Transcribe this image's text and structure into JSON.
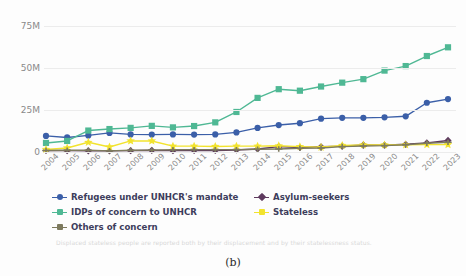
{
  "figure": {
    "title": "",
    "caption": "(b)",
    "footnote": "Displaced stateless people are reported both by their displacement and by their statelessness status."
  },
  "axes": {
    "y_ticks": [
      "0",
      "25M",
      "50M",
      "75M"
    ],
    "y_tick_values": [
      0,
      25,
      50,
      75
    ],
    "x_ticks": [
      "2004",
      "2005",
      "2006",
      "2007",
      "2008",
      "2009",
      "2010",
      "2011",
      "2012",
      "2013",
      "2014",
      "2015",
      "2016",
      "2017",
      "2018",
      "2019",
      "2020",
      "2021",
      "2022",
      "2023"
    ]
  },
  "legend": {
    "items": [
      {
        "label": "Refugees under UNHCR's mandate",
        "color": "#3b5fa8",
        "marker": "circle"
      },
      {
        "label": "Asylum-seekers",
        "color": "#5e3a5e",
        "marker": "diamond"
      },
      {
        "label": "IDPs of concern to UNHCR",
        "color": "#4fb894",
        "marker": "square"
      },
      {
        "label": "Stateless",
        "color": "#f2e32e",
        "marker": "star"
      },
      {
        "label": "Others of concern",
        "color": "#7d7a5e",
        "marker": "plus"
      }
    ]
  },
  "chart_data": {
    "type": "line",
    "title": "",
    "xlabel": "",
    "ylabel": "",
    "ylim": [
      0,
      80
    ],
    "y_unit": "millions",
    "grid": true,
    "legend_position": "bottom-left",
    "x": [
      "2004",
      "2005",
      "2006",
      "2007",
      "2008",
      "2009",
      "2010",
      "2011",
      "2012",
      "2013",
      "2014",
      "2015",
      "2016",
      "2017",
      "2018",
      "2019",
      "2020",
      "2021",
      "2022",
      "2023"
    ],
    "series": [
      {
        "name": "Refugees under UNHCR's mandate",
        "color": "#3b5fa8",
        "marker": "circle",
        "values": [
          9.6,
          8.7,
          9.9,
          11.4,
          10.5,
          10.4,
          10.5,
          10.4,
          10.5,
          11.7,
          14.4,
          16.1,
          17.2,
          19.9,
          20.4,
          20.4,
          20.7,
          21.3,
          29.4,
          31.6
        ]
      },
      {
        "name": "Asylum-seekers",
        "color": "#5e3a5e",
        "marker": "diamond",
        "values": [
          0.9,
          0.8,
          0.7,
          0.7,
          0.8,
          1.0,
          0.8,
          0.9,
          0.9,
          1.2,
          1.8,
          3.2,
          2.7,
          3.1,
          3.5,
          4.2,
          4.1,
          4.6,
          5.4,
          6.9
        ]
      },
      {
        "name": "IDPs of concern to UNHCR",
        "color": "#4fb894",
        "marker": "square",
        "values": [
          5.4,
          6.6,
          12.8,
          13.7,
          14.4,
          15.6,
          14.7,
          15.5,
          17.7,
          23.9,
          32.3,
          37.5,
          36.6,
          39.1,
          41.4,
          43.5,
          48.6,
          51.3,
          57.3,
          62.5
        ]
      },
      {
        "name": "Stateless",
        "color": "#f2e32e",
        "marker": "star",
        "values": [
          1.5,
          2.4,
          5.8,
          3.0,
          6.6,
          6.6,
          3.5,
          3.5,
          3.3,
          3.5,
          3.5,
          3.7,
          3.2,
          2.8,
          3.9,
          4.2,
          4.2,
          4.3,
          4.4,
          4.4
        ]
      },
      {
        "name": "Others of concern",
        "color": "#7d7a5e",
        "marker": "plus",
        "values": [
          0.9,
          1.0,
          1.0,
          0.7,
          1.0,
          1.1,
          1.3,
          1.4,
          1.4,
          1.4,
          1.6,
          1.8,
          2.2,
          2.4,
          3.2,
          3.6,
          3.8,
          4.3,
          5.2,
          5.8
        ]
      }
    ]
  }
}
